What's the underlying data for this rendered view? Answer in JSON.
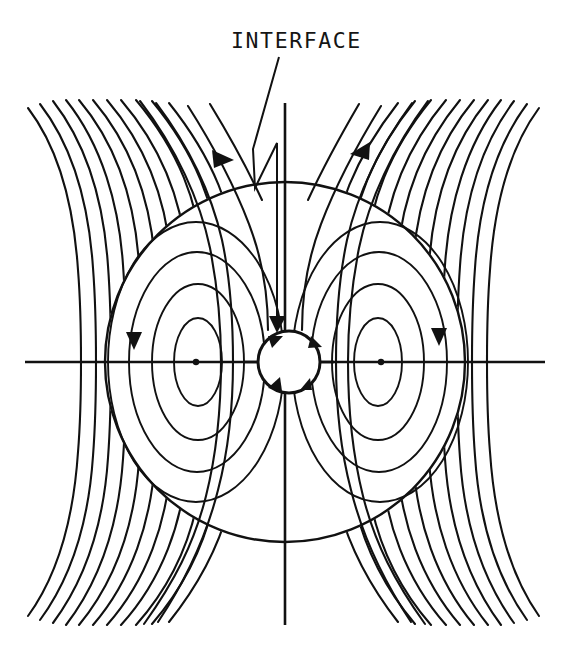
{
  "figure": {
    "title": "",
    "background_color": "#ffffff",
    "line_color": "#111111",
    "width": 567,
    "height": 654
  },
  "annotations": {
    "interface_label": "INTERFACE",
    "interface_label_x": 231,
    "interface_label_y": 48
  },
  "chart_data": {
    "type": "line",
    "title": "",
    "subtitle": "",
    "xlabel": "",
    "ylabel": "",
    "xlim": [
      -1.0,
      1.0
    ],
    "ylim": [
      -1.0,
      1.0
    ],
    "grid": false,
    "legend_position": "none",
    "annotations": [
      {
        "text": "INTERFACE",
        "x": 231,
        "y": 48,
        "leader_from": [
          279,
          57
        ],
        "leader_to": [
          277,
          331
        ],
        "arrow": "down"
      }
    ],
    "elements": {
      "outer_boundary_circle": {
        "center_x": 285,
        "center_y": 362,
        "radius": 180,
        "label": "drop-boundary"
      },
      "inner_interface_circle": {
        "center_x": 289,
        "center_y": 362,
        "radius": 31,
        "label": "interface"
      },
      "horizontal_axis": {
        "x1": 25,
        "y1": 362,
        "x2": 545,
        "y2": 362
      },
      "vertical_axis": {
        "x1": 285,
        "y1": 103,
        "x2": 285,
        "y2": 625
      },
      "vortex_centers": [
        {
          "x": 196,
          "y": 362,
          "rotation": "clockwise"
        },
        {
          "x": 381,
          "y": 362,
          "rotation": "counter-clockwise"
        }
      ],
      "field_bounds": {
        "left": 25,
        "right": 545,
        "top": 100,
        "bottom": 625
      }
    },
    "series": [
      {
        "name": "far-field-streamlines-left",
        "count": 17,
        "direction": "inflow-from-upper-left"
      },
      {
        "name": "far-field-streamlines-right",
        "count": 17,
        "direction": "inflow-from-upper-right"
      },
      {
        "name": "closed-orbit-streamlines-left-vortex",
        "count": 4
      },
      {
        "name": "closed-orbit-streamlines-right-vortex",
        "count": 4
      }
    ],
    "flow_arrows": [
      {
        "x": 221,
        "y": 158,
        "direction": "down-right",
        "on": "left-incoming-streamline"
      },
      {
        "x": 360,
        "y": 149,
        "direction": "down-left",
        "on": "right-incoming-streamline"
      },
      {
        "x": 133,
        "y": 341,
        "direction": "down",
        "on": "left-vortex-outer-orbit"
      },
      {
        "x": 438,
        "y": 337,
        "direction": "down",
        "on": "right-vortex-outer-orbit"
      },
      {
        "x": 266,
        "y": 338,
        "direction": "clockwise-tangent",
        "on": "interface-circle"
      },
      {
        "x": 312,
        "y": 338,
        "direction": "clockwise-tangent",
        "on": "interface-circle"
      },
      {
        "x": 266,
        "y": 388,
        "direction": "clockwise-tangent",
        "on": "interface-circle"
      },
      {
        "x": 312,
        "y": 388,
        "direction": "clockwise-tangent",
        "on": "interface-circle"
      }
    ]
  }
}
